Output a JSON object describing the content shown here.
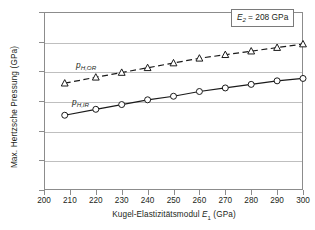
{
  "chart_data": {
    "type": "line",
    "title": "",
    "xlabel": "Kugel-Elastizitätsmodul E1 (GPa)",
    "ylabel": "Max. Hertzsche Pressung (GPa)",
    "xlim": [
      200,
      300
    ],
    "ylim": [
      2.0,
      3.5
    ],
    "xticks": [
      200,
      210,
      220,
      230,
      240,
      250,
      260,
      270,
      280,
      290,
      300
    ],
    "xtick_labels": [
      "200",
      "210",
      "220",
      "230",
      "240",
      "250",
      "260",
      "270",
      "280",
      "290",
      "300"
    ],
    "yticks": [
      2.0,
      2.25,
      2.5,
      2.75,
      3.0,
      3.25,
      3.5
    ],
    "ytick_labels": [
      "2,00",
      "2,25",
      "2,50",
      "2,75",
      "3,00",
      "3,25",
      "3,50"
    ],
    "grid": "horizontal",
    "legend_position": "inline-labels",
    "annotations": [
      {
        "name": "E2-value-box",
        "text": "E2 = 208 GPa",
        "symbol": "E",
        "subscript": "2",
        "value": "= 208 GPa"
      }
    ],
    "series": [
      {
        "name": "p_H,OR",
        "label": "p",
        "label_sub": "H,OR",
        "marker": "triangle",
        "linestyle": "dashed",
        "color": "#1a1a1a",
        "x": [
          208,
          220,
          230,
          240,
          250,
          260,
          270,
          280,
          290,
          300
        ],
        "values": [
          2.9,
          2.95,
          2.99,
          3.03,
          3.07,
          3.11,
          3.14,
          3.17,
          3.2,
          3.23
        ]
      },
      {
        "name": "p_H,IR",
        "label": "p",
        "label_sub": "H,IR",
        "marker": "circle",
        "linestyle": "solid",
        "color": "#1a1a1a",
        "x": [
          208,
          220,
          230,
          240,
          250,
          260,
          270,
          280,
          290,
          300
        ],
        "values": [
          2.63,
          2.68,
          2.72,
          2.76,
          2.79,
          2.83,
          2.86,
          2.89,
          2.92,
          2.94
        ]
      }
    ]
  },
  "axis": {
    "y_title_main": "Max. Hertzsche Pressung (GPa)",
    "x_title_main": "Kugel-Elastizitätsmodul ",
    "x_title_symbol": "E",
    "x_title_sub": "1",
    "x_title_unit": " (GPa)"
  },
  "colors": {
    "frame": "#8c8c8c",
    "grid": "#bfbfbf",
    "series": "#1a1a1a",
    "text": "#231f20",
    "background": "#ffffff"
  }
}
